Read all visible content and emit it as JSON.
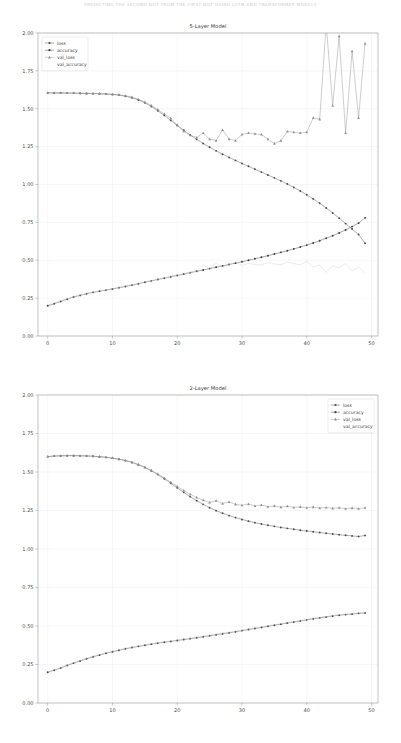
{
  "banner": "PREDICTING THE SECOND NOT FROM THE FIRST NOT USING LSTM AND TRANSFORMER MODELS",
  "figures": [
    {
      "id": "fig1",
      "title": "5-Layer Model",
      "legend_position": "upper-left"
    },
    {
      "id": "fig2",
      "title": "2-Layer Model",
      "legend_position": "upper-right"
    }
  ],
  "axes": {
    "y_ticks": [
      "0.00",
      "0.25",
      "0.50",
      "0.75",
      "1.00",
      "1.25",
      "1.50",
      "1.75",
      "2.00"
    ],
    "x_ticks": [
      "0",
      "10",
      "20",
      "30",
      "40",
      "50"
    ],
    "ylim": [
      0,
      2
    ],
    "xlim": [
      -1.5,
      51
    ],
    "grid": true
  },
  "legend_entries": [
    {
      "label": "loss",
      "color": "#4a4a4a",
      "marker": "circle"
    },
    {
      "label": "accuracy",
      "color": "#3b3b3b",
      "marker": "circle"
    },
    {
      "label": "val_loss",
      "color": "#8f8f8f",
      "marker": "triangle"
    },
    {
      "label": "val_accuracy",
      "color": "#cfcfcf",
      "marker": "line"
    }
  ],
  "chart_data": [
    {
      "type": "line",
      "title": "5-Layer Model",
      "xlabel": "",
      "ylabel": "",
      "xlim": [
        -1.5,
        51
      ],
      "ylim": [
        0,
        2
      ],
      "grid": true,
      "legend_position": "upper-left",
      "x": [
        0,
        1,
        2,
        3,
        4,
        5,
        6,
        7,
        8,
        9,
        10,
        11,
        12,
        13,
        14,
        15,
        16,
        17,
        18,
        19,
        20,
        21,
        22,
        23,
        24,
        25,
        26,
        27,
        28,
        29,
        30,
        31,
        32,
        33,
        34,
        35,
        36,
        37,
        38,
        39,
        40,
        41,
        42,
        43,
        44,
        45,
        46,
        47,
        48,
        49
      ],
      "series": [
        {
          "name": "loss",
          "color": "#4a4a4a",
          "marker": "circle",
          "values": [
            1.605,
            1.604,
            1.604,
            1.603,
            1.603,
            1.602,
            1.601,
            1.6,
            1.599,
            1.597,
            1.594,
            1.59,
            1.583,
            1.573,
            1.558,
            1.539,
            1.515,
            1.487,
            1.456,
            1.423,
            1.39,
            1.358,
            1.327,
            1.298,
            1.271,
            1.246,
            1.222,
            1.2,
            1.179,
            1.159,
            1.139,
            1.12,
            1.101,
            1.082,
            1.063,
            1.044,
            1.024,
            1.003,
            0.981,
            0.957,
            0.932,
            0.905,
            0.876,
            0.845,
            0.812,
            0.778,
            0.742,
            0.706,
            0.67,
            0.612
          ]
        },
        {
          "name": "accuracy",
          "color": "#3b3b3b",
          "marker": "circle",
          "values": [
            0.2,
            0.213,
            0.228,
            0.243,
            0.258,
            0.268,
            0.279,
            0.288,
            0.296,
            0.303,
            0.311,
            0.319,
            0.327,
            0.336,
            0.345,
            0.355,
            0.364,
            0.373,
            0.382,
            0.391,
            0.4,
            0.409,
            0.418,
            0.427,
            0.436,
            0.445,
            0.454,
            0.463,
            0.472,
            0.481,
            0.49,
            0.5,
            0.51,
            0.52,
            0.53,
            0.541,
            0.552,
            0.563,
            0.575,
            0.587,
            0.6,
            0.614,
            0.629,
            0.645,
            0.662,
            0.68,
            0.7,
            0.722,
            0.745,
            0.78
          ]
        },
        {
          "name": "val_loss",
          "color": "#8f8f8f",
          "marker": "triangle",
          "values": [
            1.606,
            1.605,
            1.605,
            1.604,
            1.604,
            1.603,
            1.602,
            1.601,
            1.6,
            1.598,
            1.596,
            1.592,
            1.586,
            1.577,
            1.563,
            1.545,
            1.522,
            1.495,
            1.466,
            1.437,
            1.392,
            1.352,
            1.325,
            1.31,
            1.34,
            1.3,
            1.29,
            1.36,
            1.3,
            1.29,
            1.33,
            1.34,
            1.335,
            1.33,
            1.3,
            1.27,
            1.29,
            1.35,
            1.345,
            1.34,
            1.345,
            1.44,
            1.43,
            2.06,
            1.52,
            1.98,
            1.34,
            1.88,
            1.44,
            1.93
          ]
        },
        {
          "name": "val_accuracy",
          "color": "#cfcfcf",
          "marker": "line",
          "values": [
            0.205,
            0.218,
            0.232,
            0.246,
            0.26,
            0.27,
            0.281,
            0.29,
            0.298,
            0.305,
            0.313,
            0.321,
            0.329,
            0.338,
            0.347,
            0.357,
            0.366,
            0.375,
            0.384,
            0.393,
            0.402,
            0.411,
            0.42,
            0.428,
            0.47,
            0.44,
            0.485,
            0.45,
            0.47,
            0.49,
            0.465,
            0.48,
            0.472,
            0.468,
            0.485,
            0.475,
            0.47,
            0.488,
            0.478,
            0.47,
            0.492,
            0.455,
            0.47,
            0.42,
            0.462,
            0.45,
            0.478,
            0.43,
            0.455,
            0.415
          ]
        }
      ]
    },
    {
      "type": "line",
      "title": "2-Layer Model",
      "xlabel": "",
      "ylabel": "",
      "xlim": [
        -1.5,
        51
      ],
      "ylim": [
        0,
        2
      ],
      "grid": true,
      "legend_position": "upper-right",
      "x": [
        0,
        1,
        2,
        3,
        4,
        5,
        6,
        7,
        8,
        9,
        10,
        11,
        12,
        13,
        14,
        15,
        16,
        17,
        18,
        19,
        20,
        21,
        22,
        23,
        24,
        25,
        26,
        27,
        28,
        29,
        30,
        31,
        32,
        33,
        34,
        35,
        36,
        37,
        38,
        39,
        40,
        41,
        42,
        43,
        44,
        45,
        46,
        47,
        48,
        49
      ],
      "series": [
        {
          "name": "loss",
          "color": "#4a4a4a",
          "marker": "circle",
          "values": [
            1.6,
            1.603,
            1.605,
            1.606,
            1.606,
            1.605,
            1.604,
            1.602,
            1.599,
            1.595,
            1.59,
            1.583,
            1.574,
            1.562,
            1.547,
            1.529,
            1.508,
            1.483,
            1.456,
            1.427,
            1.397,
            1.368,
            1.34,
            1.314,
            1.29,
            1.268,
            1.249,
            1.232,
            1.217,
            1.204,
            1.192,
            1.181,
            1.171,
            1.162,
            1.154,
            1.147,
            1.14,
            1.134,
            1.128,
            1.122,
            1.117,
            1.112,
            1.107,
            1.102,
            1.097,
            1.093,
            1.089,
            1.085,
            1.081,
            1.088
          ]
        },
        {
          "name": "accuracy",
          "color": "#3b3b3b",
          "marker": "circle",
          "values": [
            0.2,
            0.213,
            0.228,
            0.244,
            0.259,
            0.273,
            0.287,
            0.3,
            0.312,
            0.323,
            0.333,
            0.343,
            0.352,
            0.36,
            0.368,
            0.375,
            0.382,
            0.389,
            0.395,
            0.4,
            0.406,
            0.412,
            0.418,
            0.424,
            0.43,
            0.437,
            0.443,
            0.45,
            0.456,
            0.463,
            0.47,
            0.477,
            0.484,
            0.491,
            0.498,
            0.505,
            0.512,
            0.519,
            0.526,
            0.533,
            0.54,
            0.547,
            0.553,
            0.559,
            0.565,
            0.57,
            0.574,
            0.578,
            0.582,
            0.585
          ]
        },
        {
          "name": "val_loss",
          "color": "#8f8f8f",
          "marker": "triangle",
          "values": [
            1.601,
            1.604,
            1.606,
            1.607,
            1.607,
            1.606,
            1.605,
            1.603,
            1.6,
            1.596,
            1.591,
            1.584,
            1.575,
            1.564,
            1.549,
            1.531,
            1.511,
            1.487,
            1.461,
            1.434,
            1.406,
            1.38,
            1.356,
            1.335,
            1.317,
            1.302,
            1.314,
            1.295,
            1.306,
            1.29,
            1.284,
            1.292,
            1.28,
            1.286,
            1.275,
            1.28,
            1.272,
            1.278,
            1.27,
            1.274,
            1.268,
            1.272,
            1.266,
            1.27,
            1.264,
            1.268,
            1.262,
            1.266,
            1.262,
            1.268
          ]
        },
        {
          "name": "val_accuracy",
          "color": "#cfcfcf",
          "marker": "line",
          "values": [
            0.203,
            0.216,
            0.231,
            0.247,
            0.262,
            0.276,
            0.29,
            0.303,
            0.315,
            0.326,
            0.336,
            0.346,
            0.355,
            0.363,
            0.371,
            0.378,
            0.385,
            0.392,
            0.398,
            0.403,
            0.409,
            0.415,
            0.421,
            0.427,
            0.433,
            0.44,
            0.446,
            0.453,
            0.459,
            0.466,
            0.473,
            0.48,
            0.487,
            0.494,
            0.501,
            0.508,
            0.515,
            0.522,
            0.529,
            0.536,
            0.543,
            0.55,
            0.556,
            0.562,
            0.568,
            0.573,
            0.577,
            0.581,
            0.585,
            0.588
          ]
        }
      ]
    }
  ]
}
